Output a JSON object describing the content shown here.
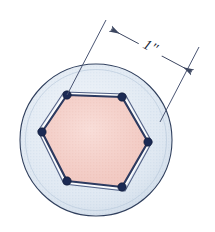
{
  "figure": {
    "name": "hexagon-inscribed-in-circle",
    "caption": "",
    "background_color": "#ffffff"
  },
  "dimension": {
    "label": "1\"",
    "value": 1,
    "unit": "inch",
    "measures": "hexagon-side-length",
    "line_color": "#3c4660",
    "text_color": "#222a3a",
    "rotation_deg": 28
  },
  "circle": {
    "name": "outer-circle",
    "center": {
      "x": 96,
      "y": 140
    },
    "radius": 76,
    "fill_color": "#dde7f1",
    "stroke_color": "#31405e",
    "stroke_width": 1.1
  },
  "hexagon": {
    "name": "inscribed-hexagon",
    "sides": 6,
    "fill_color": "#f5ccc5",
    "edge_color": "#2c3a60",
    "edge_width": 2.2,
    "highlight_color": "#ffffff",
    "vertices": [
      {
        "id": "v1",
        "label": "top-left",
        "x": 67,
        "y": 95
      },
      {
        "id": "v2",
        "label": "top-right",
        "x": 122,
        "y": 97
      },
      {
        "id": "v3",
        "label": "right",
        "x": 148,
        "y": 142
      },
      {
        "id": "v4",
        "label": "bottom-right",
        "x": 122,
        "y": 187
      },
      {
        "id": "v5",
        "label": "bottom-left",
        "x": 67,
        "y": 181
      },
      {
        "id": "v6",
        "label": "left",
        "x": 42,
        "y": 132
      }
    ],
    "vertex_marker": {
      "name": "vertex-dot",
      "radius": 4.2,
      "fill_color": "#1b2a54",
      "stroke_color": "#0e1833"
    }
  },
  "extension_lines": [
    {
      "id": "ext-left",
      "x1": 67,
      "y1": 95,
      "x2": 106,
      "y2": 20,
      "color": "#4a5573"
    },
    {
      "id": "ext-right",
      "x1": 160,
      "y1": 122,
      "x2": 199,
      "y2": 47,
      "color": "#4a5573"
    }
  ],
  "dimension_line": {
    "x1": 111,
    "y1": 29,
    "x2": 192,
    "y2": 72,
    "arrow_start": "arrow-head-upper-left",
    "arrow_end": "arrow-head-lower-right",
    "color": "#3c4660"
  }
}
